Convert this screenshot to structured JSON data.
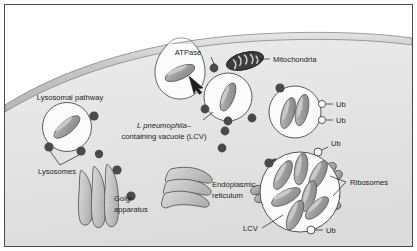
{
  "figure": {
    "domain": "diagram",
    "frame_border_color": "#4a4a4a",
    "background_color": "#ffffff"
  },
  "colors": {
    "cell_cytoplasm_light": "#efefef",
    "cell_cytoplasm_dark": "#d8d8d8",
    "membrane_band": "#c9c9c9",
    "membrane_stroke": "#6a6a6a",
    "bacterium_fill": "#9a9a9a",
    "bacterium_highlight": "#c4c4c4",
    "bacterium_stroke": "#5a5a5a",
    "vacuole_fill": "#fbfbfb",
    "vacuole_stroke": "#4a4a4a",
    "lysosome_dot": "#4a4a4a",
    "ubiquitin_fill": "#f4f4f4",
    "ubiquitin_stroke": "#3a3a3a",
    "golgi_fill": "#cfcfcf",
    "golgi_stroke": "#4a4a4a",
    "er_fill": "#d5d5d5",
    "er_stroke": "#4a4a4a",
    "mitochondria_fill": "#3f3f3f",
    "mitochondria_stroke": "#1c1c1c",
    "ribosome_fill": "#adadad",
    "ribosome_stroke": "#4a4a4a",
    "label_text": "#1c1c1c",
    "arrow_fill": "#1c1c1c"
  },
  "labels": {
    "atpase": "ATPase",
    "mitochondria": "Mitochondria",
    "lysosomal_pathway": "Lysosomal pathway",
    "lysosomes": "Lysosomes",
    "golgi_line1": "Golgi",
    "golgi_line2": "apparatus",
    "lcv_name_italic": "L pneumophila",
    "lcv_name_dash": "–",
    "lcv_name_line2": "containing vacuole (LCV)",
    "er_line1": "Endoplasmic",
    "er_line2": "reticulum",
    "ribosomes": "Ribosomes",
    "lcv_short": "LCV",
    "ub_1": "Ub",
    "ub_2": "Ub",
    "ub_3": "Ub",
    "ub_4": "Ub"
  },
  "structures": {
    "phagocytic_cup": {
      "name": "entry vacuole at plasma membrane",
      "bacteria_count": 1
    },
    "early_lcv": {
      "name": "L. pneumophila-containing vacuole",
      "bacteria_count": 1,
      "surface_dots": 5
    },
    "replicative_lcv_small": {
      "name": "LCV with two bacteria and ubiquitin",
      "bacteria_count": 2,
      "ubiquitin_count": 2
    },
    "replicative_lcv_large": {
      "name": "mature ribosome-studded LCV",
      "bacteria_count": 7,
      "ubiquitin_count": 2,
      "ribosome_clusters": 4
    },
    "lysosomal_vacuole": {
      "name": "lysosomal pathway vacuole",
      "bacteria_count": 1,
      "lysosome_dots": 3
    },
    "golgi": {
      "cisternae": 3
    },
    "endoplasmic_reticulum": {
      "cisternae": 3
    },
    "mitochondria": {
      "count": 1
    },
    "free_lysosomes": 4
  }
}
